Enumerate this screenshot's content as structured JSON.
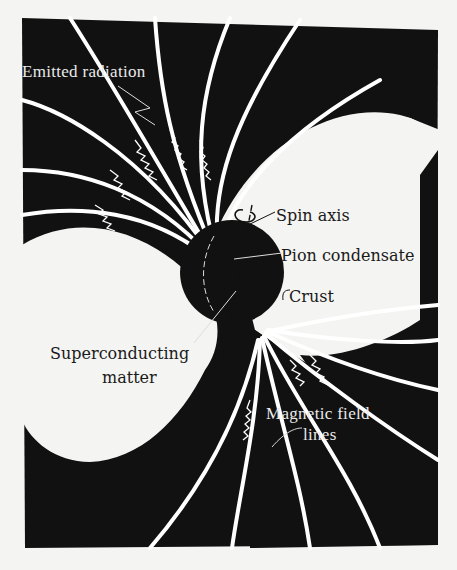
{
  "figure": {
    "background_color": "#f4f4f2",
    "ink_color": "#111111",
    "line_color": "#ffffff"
  },
  "labels": {
    "emitted_radiation": "Emitted radiation",
    "spin_axis": "Spin axis",
    "pion_condensate": "Pion condensate",
    "crust": "Crust",
    "superconducting_line1": "Superconducting",
    "superconducting_line2": "matter",
    "magnetic_line1": "Magnetic field",
    "magnetic_line2": "lines"
  }
}
